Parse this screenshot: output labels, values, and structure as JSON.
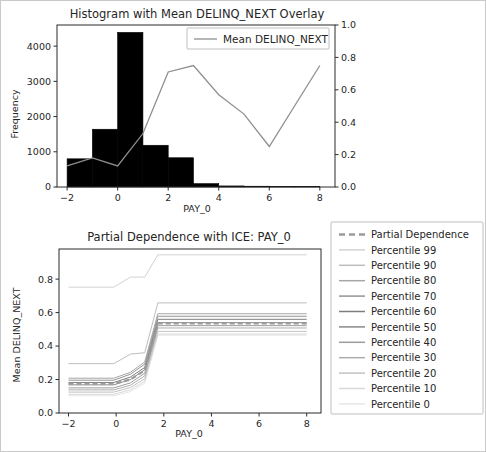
{
  "figure": {
    "background": "#ffffff",
    "border_color": "#c9c9c9",
    "width": 486,
    "height": 452
  },
  "chart_data": [
    {
      "id": "histogram-panel",
      "type": "bar",
      "title": "Histogram with Mean DELINQ_NEXT Overlay",
      "xlabel": "PAY_0",
      "ylabel": "Frequency",
      "y2label": "",
      "grid": false,
      "xlim": [
        -2.4,
        8.6
      ],
      "ylim": [
        0,
        4600
      ],
      "y2lim": [
        0.0,
        1.0
      ],
      "xticks": [
        -2,
        0,
        2,
        4,
        6,
        8
      ],
      "xticklabels": [
        "−2",
        "0",
        "2",
        "4",
        "6",
        "8"
      ],
      "yticks": [
        0,
        1000,
        2000,
        3000,
        4000
      ],
      "yticklabels": [
        "0",
        "1000",
        "2000",
        "3000",
        "4000"
      ],
      "y2ticks": [
        0.0,
        0.2,
        0.4,
        0.6,
        0.8,
        1.0
      ],
      "y2ticklabels": [
        "0.0",
        "0.2",
        "0.4",
        "0.6",
        "0.8",
        "1.0"
      ],
      "bar_color": "#000000",
      "bins": [
        {
          "left": -2.0,
          "right": -1.0,
          "value": 800
        },
        {
          "left": -1.0,
          "right": 0.0,
          "value": 1640
        },
        {
          "left": 0.0,
          "right": 1.0,
          "value": 4390
        },
        {
          "left": 1.0,
          "right": 2.0,
          "value": 1185
        },
        {
          "left": 2.0,
          "right": 3.0,
          "value": 830
        },
        {
          "left": 3.0,
          "right": 4.0,
          "value": 95
        },
        {
          "left": 4.0,
          "right": 5.0,
          "value": 30
        },
        {
          "left": 5.0,
          "right": 6.0,
          "value": 22
        },
        {
          "left": 6.0,
          "right": 7.0,
          "value": 12
        },
        {
          "left": 7.0,
          "right": 8.0,
          "value": 10
        }
      ],
      "overlay": {
        "name": "Mean DELINQ_NEXT",
        "color": "#8f8f8f",
        "x": [
          -2,
          -1,
          0,
          1,
          2,
          3,
          4,
          5,
          6,
          7,
          8
        ],
        "y": [
          0.13,
          0.18,
          0.13,
          0.33,
          0.71,
          0.75,
          0.57,
          0.45,
          0.25,
          0.5,
          0.75
        ]
      },
      "legend": {
        "position": "upper-center",
        "entries": [
          {
            "label": "Mean DELINQ_NEXT",
            "color": "#8f8f8f",
            "style": "solid"
          }
        ]
      }
    },
    {
      "id": "pdp-ice-panel",
      "type": "line",
      "title": "Partial Dependence with ICE: PAY_0",
      "xlabel": "PAY_0",
      "ylabel": "Mean DELINQ_NEXT",
      "grid": false,
      "xlim": [
        -2.4,
        8.6
      ],
      "ylim": [
        0.0,
        0.98
      ],
      "xticks": [
        -2,
        0,
        2,
        4,
        6,
        8
      ],
      "xticklabels": [
        "−2",
        "0",
        "2",
        "4",
        "6",
        "8"
      ],
      "yticks": [
        0.0,
        0.2,
        0.4,
        0.6,
        0.8
      ],
      "yticklabels": [
        "0.0",
        "0.2",
        "0.4",
        "0.6",
        "0.8"
      ],
      "x": [
        -2,
        -0.1,
        0.6,
        1.2,
        1.75,
        8
      ],
      "series": [
        {
          "name": "Partial Dependence",
          "style": "dashed",
          "color": "#9a9a9a",
          "width": 2.2,
          "values": [
            0.175,
            0.175,
            0.2,
            0.255,
            0.535,
            0.535
          ]
        },
        {
          "name": "Percentile 99",
          "style": "solid",
          "color": "#d2d2d2",
          "width": 1.0,
          "values": [
            0.752,
            0.752,
            0.812,
            0.812,
            0.945,
            0.945
          ]
        },
        {
          "name": "Percentile 90",
          "style": "solid",
          "color": "#bdbdbd",
          "width": 1.0,
          "values": [
            0.295,
            0.295,
            0.352,
            0.36,
            0.658,
            0.658
          ]
        },
        {
          "name": "Percentile 80",
          "style": "solid",
          "color": "#a6a6a6",
          "width": 1.0,
          "values": [
            0.208,
            0.208,
            0.243,
            0.305,
            0.593,
            0.593
          ]
        },
        {
          "name": "Percentile 70",
          "style": "solid",
          "color": "#949494",
          "width": 1.0,
          "values": [
            0.196,
            0.196,
            0.232,
            0.292,
            0.578,
            0.578
          ]
        },
        {
          "name": "Percentile 60",
          "style": "solid",
          "color": "#7d7d7d",
          "width": 1.0,
          "values": [
            0.182,
            0.182,
            0.215,
            0.272,
            0.56,
            0.56
          ]
        },
        {
          "name": "Percentile 50",
          "style": "solid",
          "color": "#8a8a8a",
          "width": 1.0,
          "values": [
            0.168,
            0.168,
            0.2,
            0.258,
            0.54,
            0.54
          ]
        },
        {
          "name": "Percentile 40",
          "style": "solid",
          "color": "#9c9c9c",
          "width": 1.0,
          "values": [
            0.15,
            0.15,
            0.18,
            0.238,
            0.522,
            0.522
          ]
        },
        {
          "name": "Percentile 30",
          "style": "solid",
          "color": "#adadad",
          "width": 1.0,
          "values": [
            0.138,
            0.138,
            0.166,
            0.222,
            0.508,
            0.508
          ]
        },
        {
          "name": "Percentile 20",
          "style": "solid",
          "color": "#c2c2c2",
          "width": 1.0,
          "values": [
            0.125,
            0.125,
            0.152,
            0.205,
            0.488,
            0.488
          ]
        },
        {
          "name": "Percentile 10",
          "style": "solid",
          "color": "#d8d8d8",
          "width": 1.0,
          "values": [
            0.112,
            0.112,
            0.138,
            0.19,
            0.472,
            0.472
          ]
        },
        {
          "name": "Percentile 0",
          "style": "solid",
          "color": "#e6e6e6",
          "width": 1.0,
          "values": [
            0.103,
            0.103,
            0.128,
            0.178,
            0.465,
            0.465
          ]
        }
      ],
      "legend": {
        "position": "right-outside",
        "entries": [
          {
            "label": "Partial Dependence",
            "color": "#9a9a9a",
            "style": "dashed"
          },
          {
            "label": "Percentile 99",
            "color": "#d2d2d2",
            "style": "solid"
          },
          {
            "label": "Percentile 90",
            "color": "#bdbdbd",
            "style": "solid"
          },
          {
            "label": "Percentile 80",
            "color": "#a6a6a6",
            "style": "solid"
          },
          {
            "label": "Percentile 70",
            "color": "#949494",
            "style": "solid"
          },
          {
            "label": "Percentile 60",
            "color": "#7d7d7d",
            "style": "solid"
          },
          {
            "label": "Percentile 50",
            "color": "#8a8a8a",
            "style": "solid"
          },
          {
            "label": "Percentile 40",
            "color": "#9c9c9c",
            "style": "solid"
          },
          {
            "label": "Percentile 30",
            "color": "#adadad",
            "style": "solid"
          },
          {
            "label": "Percentile 20",
            "color": "#c2c2c2",
            "style": "solid"
          },
          {
            "label": "Percentile 10",
            "color": "#d8d8d8",
            "style": "solid"
          },
          {
            "label": "Percentile 0",
            "color": "#e6e6e6",
            "style": "solid"
          }
        ]
      }
    }
  ]
}
